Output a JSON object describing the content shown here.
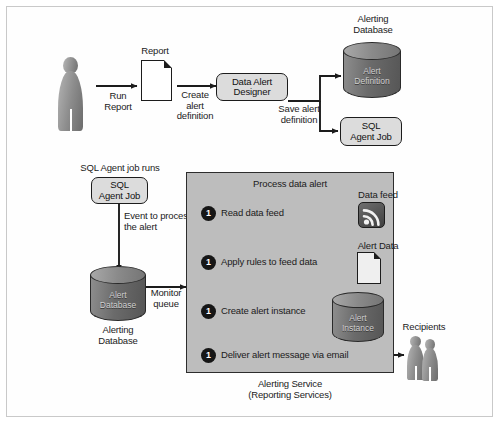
{
  "diagram": {
    "colors": {
      "panel_fill": "#bdbdbd",
      "panel_border": "#2d2d2d",
      "pill_fill": "#dcdcdc",
      "bullet_fill": "#161616",
      "ink": "#1c1c1c",
      "frame_border": "#c9c9c9"
    }
  },
  "top_flow": {
    "actor_label": "",
    "arrow1_label": "Run\nReport",
    "report_label": "Report",
    "arrow2_label": "Create\nalert\ndefinition",
    "designer_label": "Data Alert\nDesigner",
    "arrow3_label": "Save alert\ndefinition",
    "alerting_database_label": "Alerting\nDatabase",
    "alert_definition_label": "Alert\nDefinition",
    "sql_agent_job_label": "SQL\nAgent Job"
  },
  "left_flow": {
    "agent_runs_label": "SQL Agent job runs",
    "sql_agent_job_label": "SQL\nAgent Job",
    "event_label": "Event to process\nthe alert",
    "alert_database_label": "Alert\nDatabase",
    "alerting_database_caption": "Alerting\nDatabase",
    "monitor_queue_label": "Monitor\nqueue"
  },
  "panel": {
    "title": "Process data alert",
    "caption": "Alerting Service\n(Reporting Services)",
    "steps": [
      {
        "number": "1",
        "text": "Read data feed"
      },
      {
        "number": "1",
        "text": "Apply rules to feed data"
      },
      {
        "number": "1",
        "text": "Create alert instance"
      },
      {
        "number": "1",
        "text": "Deliver alert message via email"
      }
    ],
    "assets": {
      "data_feed_label": "Data feed",
      "alert_data_label": "Alert Data",
      "alert_instance_label": "Alert\nInstance"
    }
  },
  "recipients": {
    "label": "Recipients"
  }
}
